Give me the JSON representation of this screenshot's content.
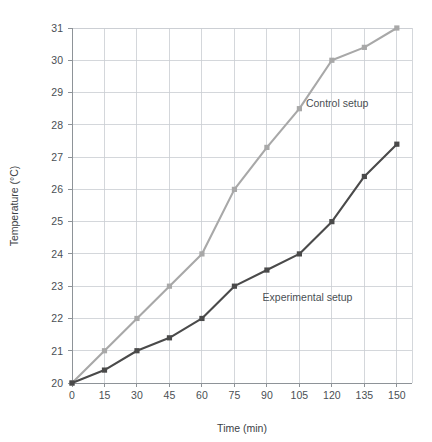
{
  "chart_data": {
    "type": "line",
    "title": "",
    "xlabel": "Time (min)",
    "ylabel": "Temperature (°C)",
    "x": [
      0,
      15,
      30,
      45,
      60,
      75,
      90,
      105,
      120,
      135,
      150
    ],
    "xtick_labels": [
      "0",
      "15",
      "30",
      "45",
      "60",
      "75",
      "90",
      "105",
      "120",
      "135",
      "150"
    ],
    "ytick_labels": [
      "20",
      "21",
      "22",
      "23",
      "24",
      "25",
      "26",
      "27",
      "28",
      "29",
      "30",
      "31"
    ],
    "yticks": [
      20,
      21,
      22,
      23,
      24,
      25,
      26,
      27,
      28,
      29,
      30,
      31
    ],
    "xlim": [
      0,
      157
    ],
    "ylim": [
      20,
      31
    ],
    "grid": true,
    "legend_position": "inline-annotation",
    "series": [
      {
        "name": "Control setup",
        "color": "#a8a8a8",
        "marker": "square",
        "values": [
          20,
          21,
          22,
          23,
          24,
          26,
          27.3,
          28.5,
          30,
          30.4,
          31
        ],
        "annotation": {
          "text": "Control setup",
          "x": 108,
          "y": 28.55
        }
      },
      {
        "name": "Experimental setup",
        "color": "#4a4a4a",
        "marker": "square",
        "values": [
          20,
          20.4,
          21,
          21.4,
          22,
          23,
          23.5,
          24,
          25,
          26.4,
          27.4
        ],
        "annotation": {
          "text": "Experimental setup",
          "x": 88,
          "y": 22.55
        }
      }
    ]
  }
}
